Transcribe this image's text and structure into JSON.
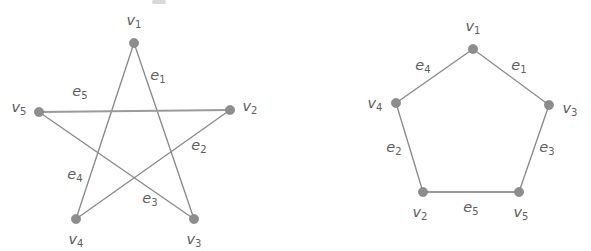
{
  "figure": {
    "title": "",
    "background_color": "#ffffff",
    "edge_color": "#8a8a8a",
    "vertex_color": "#8d8d8d",
    "label_color": "#5e5e5e"
  },
  "graphs": [
    {
      "id": "left-graph",
      "name": "pentagram-graph",
      "shape": "star",
      "vertices": [
        {
          "id": "v1",
          "label": "v",
          "sub": "1",
          "x": 134,
          "y": 43,
          "label_x": 134,
          "label_y": 21
        },
        {
          "id": "v2",
          "label": "v",
          "sub": "2",
          "x": 230,
          "y": 110,
          "label_x": 250,
          "label_y": 107
        },
        {
          "id": "v3",
          "label": "v",
          "sub": "3",
          "x": 194,
          "y": 219,
          "label_x": 194,
          "label_y": 240
        },
        {
          "id": "v4",
          "label": "v",
          "sub": "4",
          "x": 76,
          "y": 219,
          "label_x": 76,
          "label_y": 240
        },
        {
          "id": "v5",
          "label": "v",
          "sub": "5",
          "x": 39,
          "y": 112,
          "label_x": 19,
          "label_y": 108
        }
      ],
      "edges": [
        {
          "id": "e1",
          "label": "e",
          "sub": "1",
          "from": "v1",
          "to": "v3",
          "label_x": 158,
          "label_y": 76,
          "thick": false
        },
        {
          "id": "e2",
          "label": "e",
          "sub": "2",
          "from": "v2",
          "to": "v4",
          "label_x": 199,
          "label_y": 146,
          "thick": false
        },
        {
          "id": "e3",
          "label": "e",
          "sub": "3",
          "from": "v4",
          "to": "v1",
          "label_x": 150,
          "label_y": 199,
          "thick": false
        },
        {
          "id": "e4",
          "label": "e",
          "sub": "4",
          "from": "v5",
          "to": "v3",
          "label_x": 75,
          "label_y": 175,
          "thick": false
        },
        {
          "id": "e5",
          "label": "e",
          "sub": "5",
          "from": "v5",
          "to": "v2",
          "label_x": 80,
          "label_y": 92,
          "thick": true
        }
      ]
    },
    {
      "id": "right-graph",
      "name": "pentagon-graph",
      "shape": "pentagon",
      "vertices": [
        {
          "id": "v1",
          "label": "v",
          "sub": "1",
          "x": 473,
          "y": 49,
          "label_x": 473,
          "label_y": 27
        },
        {
          "id": "v3",
          "label": "v",
          "sub": "3",
          "x": 549,
          "y": 105,
          "label_x": 570,
          "label_y": 109
        },
        {
          "id": "v5",
          "label": "v",
          "sub": "5",
          "x": 519,
          "y": 192,
          "label_x": 521,
          "label_y": 213
        },
        {
          "id": "v2",
          "label": "v",
          "sub": "2",
          "x": 423,
          "y": 192,
          "label_x": 420,
          "label_y": 213
        },
        {
          "id": "v4",
          "label": "v",
          "sub": "4",
          "x": 396,
          "y": 103,
          "label_x": 375,
          "label_y": 104
        }
      ],
      "edges": [
        {
          "id": "e1",
          "label": "e",
          "sub": "1",
          "from": "v1",
          "to": "v3",
          "label_x": 519,
          "label_y": 66,
          "thick": false
        },
        {
          "id": "e2",
          "label": "e",
          "sub": "2",
          "from": "v4",
          "to": "v2",
          "label_x": 394,
          "label_y": 148,
          "thick": false
        },
        {
          "id": "e3",
          "label": "e",
          "sub": "3",
          "from": "v3",
          "to": "v5",
          "label_x": 547,
          "label_y": 148,
          "thick": false
        },
        {
          "id": "e4",
          "label": "e",
          "sub": "4",
          "from": "v1",
          "to": "v4",
          "label_x": 423,
          "label_y": 66,
          "thick": false
        },
        {
          "id": "e5",
          "label": "e",
          "sub": "5",
          "from": "v2",
          "to": "v5",
          "label_x": 471,
          "label_y": 208,
          "thick": true
        }
      ]
    }
  ],
  "artifact": {
    "name": "scan-smudge",
    "x": 152,
    "y": 0,
    "width": 14,
    "height": 4
  }
}
